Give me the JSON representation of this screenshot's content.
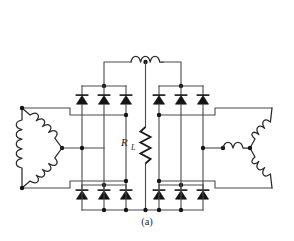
{
  "figure": {
    "caption": "(a)"
  },
  "labels": {
    "load_resistor": "R",
    "load_resistor_subscript": "L"
  },
  "components": {
    "interphase_transformer": {
      "name": "interphase-transformer-inductor",
      "humps": 3,
      "center_tap": true
    },
    "load": {
      "name": "load-resistor",
      "designator": "R_L",
      "zigzags": 5
    },
    "left_transformer": {
      "name": "delta-connected-secondary",
      "winding_count": 3,
      "connection": "delta"
    },
    "right_transformer": {
      "name": "wye-connected-secondary",
      "winding_count": 3,
      "connection": "wye"
    },
    "bridges": [
      {
        "name": "left-upper-diode-group",
        "diode_count": 3,
        "position": "top-left"
      },
      {
        "name": "left-lower-diode-group",
        "diode_count": 3,
        "position": "bottom-left"
      },
      {
        "name": "right-upper-diode-group",
        "diode_count": 3,
        "position": "top-right"
      },
      {
        "name": "right-lower-diode-group",
        "diode_count": 3,
        "position": "bottom-right"
      }
    ],
    "total_diodes": 12
  },
  "colors": {
    "wire": "#4a4a4a",
    "component": "#1a1a1a",
    "node": "#141414",
    "background": "#ffffff"
  }
}
